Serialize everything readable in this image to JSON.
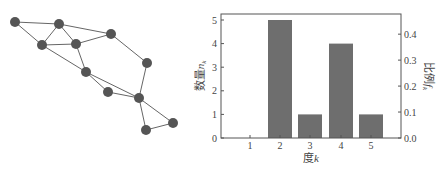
{
  "graph": {
    "node_color": "#555555",
    "edge_color": "#666666",
    "node_radius": 5,
    "nodes": [
      {
        "id": "A",
        "x": 15,
        "y": 22
      },
      {
        "id": "B",
        "x": 59,
        "y": 24
      },
      {
        "id": "C",
        "x": 42,
        "y": 45
      },
      {
        "id": "D",
        "x": 76,
        "y": 44
      },
      {
        "id": "E",
        "x": 111,
        "y": 34
      },
      {
        "id": "F",
        "x": 86,
        "y": 72
      },
      {
        "id": "G",
        "x": 147,
        "y": 63
      },
      {
        "id": "H",
        "x": 108,
        "y": 92
      },
      {
        "id": "I",
        "x": 139,
        "y": 98
      },
      {
        "id": "J",
        "x": 173,
        "y": 123
      },
      {
        "id": "K",
        "x": 146,
        "y": 130
      }
    ],
    "edges": [
      [
        "A",
        "B"
      ],
      [
        "A",
        "C"
      ],
      [
        "B",
        "C"
      ],
      [
        "B",
        "D"
      ],
      [
        "B",
        "E"
      ],
      [
        "C",
        "D"
      ],
      [
        "D",
        "E"
      ],
      [
        "C",
        "F"
      ],
      [
        "D",
        "F"
      ],
      [
        "E",
        "G"
      ],
      [
        "F",
        "H"
      ],
      [
        "F",
        "I"
      ],
      [
        "H",
        "I"
      ],
      [
        "G",
        "I"
      ],
      [
        "I",
        "J"
      ],
      [
        "I",
        "K"
      ],
      [
        "K",
        "J"
      ]
    ]
  },
  "chart_data": {
    "type": "bar",
    "title": "",
    "xlabel": "度k",
    "ylabel": "数量n_k",
    "ylabel_right": "比例f_k",
    "categories": [
      "1",
      "2",
      "3",
      "4",
      "5"
    ],
    "values": [
      0,
      5,
      1,
      4,
      1
    ],
    "series": [
      {
        "name": "数量n_k",
        "values": [
          0,
          5,
          1,
          4,
          1
        ]
      },
      {
        "name": "比例f_k",
        "values": [
          0.0,
          0.4545,
          0.0909,
          0.3636,
          0.0909
        ]
      }
    ],
    "ylim": [
      0,
      5.2
    ],
    "ylim_right": [
      0,
      0.473
    ],
    "yticks": [
      "0",
      "1",
      "2",
      "3",
      "4",
      "5"
    ],
    "yticks_right": [
      "0.0",
      "0.1",
      "0.2",
      "0.3",
      "0.4"
    ],
    "bar_color": "#6e6e6e",
    "grid": false,
    "legend": "none"
  },
  "labels": {
    "xlabel_main": "度",
    "xlabel_var": "k",
    "ylabel_main": "数量",
    "ylabel_var": "n",
    "ylabel_sub": "k",
    "ylabel_right_main": "比例",
    "ylabel_right_var": "f",
    "ylabel_right_sub": "k"
  }
}
